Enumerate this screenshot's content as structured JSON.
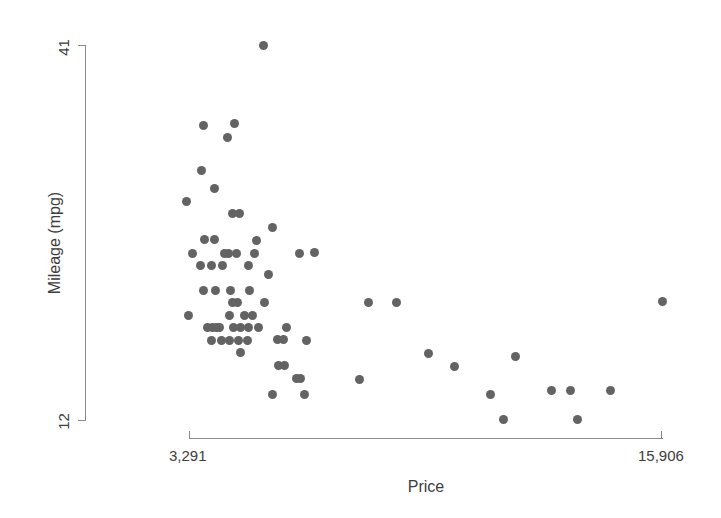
{
  "figure": {
    "width": 721,
    "height": 518,
    "background": "#ffffff",
    "marker_color": "#636363",
    "axis_color": "#8a8a8a",
    "text_color": "#3d3d3d"
  },
  "axes": {
    "y_title": "Mileage (mpg)",
    "x_title": "Price",
    "y_tick_min_label": "12",
    "y_tick_max_label": "41",
    "x_tick_min_label": "3,291",
    "x_tick_max_label": "15,906"
  },
  "chart_data": {
    "type": "scatter",
    "title": "",
    "xlabel": "Price",
    "ylabel": "Mileage (mpg)",
    "xlim": [
      3291,
      15906
    ],
    "ylim": [
      12,
      41
    ],
    "xtick_labels": [
      "3,291",
      "15,906"
    ],
    "ytick_labels": [
      "12",
      "41"
    ],
    "grid": false,
    "legend": null,
    "marker": "circle",
    "marker_color": "#636363",
    "n_points": 74,
    "points": [
      {
        "x": 5222,
        "y": 41
      },
      {
        "x": 4187,
        "y": 35
      },
      {
        "x": 4816,
        "y": 35
      },
      {
        "x": 4504,
        "y": 34
      },
      {
        "x": 4172,
        "y": 31
      },
      {
        "x": 4389,
        "y": 30
      },
      {
        "x": 3748,
        "y": 29
      },
      {
        "x": 4697,
        "y": 28
      },
      {
        "x": 4816,
        "y": 28
      },
      {
        "x": 4195,
        "y": 26
      },
      {
        "x": 4452,
        "y": 26
      },
      {
        "x": 5799,
        "y": 26
      },
      {
        "x": 6229,
        "y": 26
      },
      {
        "x": 4504,
        "y": 25
      },
      {
        "x": 4647,
        "y": 25
      },
      {
        "x": 5379,
        "y": 25
      },
      {
        "x": 8129,
        "y": 25
      },
      {
        "x": 4172,
        "y": 24
      },
      {
        "x": 4589,
        "y": 24
      },
      {
        "x": 5189,
        "y": 24
      },
      {
        "x": 5705,
        "y": 23
      },
      {
        "x": 6486,
        "y": 23
      },
      {
        "x": 4187,
        "y": 22
      },
      {
        "x": 4482,
        "y": 22
      },
      {
        "x": 4934,
        "y": 22
      },
      {
        "x": 5379,
        "y": 22
      },
      {
        "x": 4697,
        "y": 21
      },
      {
        "x": 4723,
        "y": 21
      },
      {
        "x": 6850,
        "y": 21
      },
      {
        "x": 7402,
        "y": 21
      },
      {
        "x": 15906,
        "y": 21
      },
      {
        "x": 3799,
        "y": 20
      },
      {
        "x": 4934,
        "y": 20
      },
      {
        "x": 5222,
        "y": 20
      },
      {
        "x": 4296,
        "y": 19
      },
      {
        "x": 4389,
        "y": 19
      },
      {
        "x": 4452,
        "y": 19
      },
      {
        "x": 4482,
        "y": 19
      },
      {
        "x": 4816,
        "y": 19
      },
      {
        "x": 4934,
        "y": 19
      },
      {
        "x": 5104,
        "y": 19
      },
      {
        "x": 5379,
        "y": 19
      },
      {
        "x": 4425,
        "y": 18
      },
      {
        "x": 4733,
        "y": 18
      },
      {
        "x": 4890,
        "y": 18
      },
      {
        "x": 5104,
        "y": 18
      },
      {
        "x": 5705,
        "y": 18
      },
      {
        "x": 5788,
        "y": 18
      },
      {
        "x": 4934,
        "y": 17
      },
      {
        "x": 6303,
        "y": 17
      },
      {
        "x": 8814,
        "y": 17
      },
      {
        "x": 9690,
        "y": 17
      },
      {
        "x": 5705,
        "y": 16
      },
      {
        "x": 5788,
        "y": 16
      },
      {
        "x": 9100,
        "y": 16
      },
      {
        "x": 6165,
        "y": 15
      },
      {
        "x": 7827,
        "y": 15
      },
      {
        "x": 10372,
        "y": 14
      },
      {
        "x": 11385,
        "y": 14
      },
      {
        "x": 12990,
        "y": 14
      },
      {
        "x": 13594,
        "y": 14
      },
      {
        "x": 5469,
        "y": 14
      },
      {
        "x": 6229,
        "y": 14
      },
      {
        "x": 10372,
        "y": 12
      },
      {
        "x": 13466,
        "y": 12
      }
    ]
  },
  "pixel_points": [
    [
      263,
      45
    ],
    [
      203,
      125
    ],
    [
      234,
      123
    ],
    [
      227,
      137
    ],
    [
      201,
      170
    ],
    [
      214,
      188
    ],
    [
      186,
      201
    ],
    [
      232,
      213
    ],
    [
      239,
      213
    ],
    [
      204,
      239
    ],
    [
      214,
      239
    ],
    [
      256,
      240
    ],
    [
      272,
      227
    ],
    [
      228,
      253
    ],
    [
      236,
      253
    ],
    [
      254,
      253
    ],
    [
      314,
      252
    ],
    [
      200,
      265
    ],
    [
      222,
      265
    ],
    [
      248,
      265
    ],
    [
      268,
      274
    ],
    [
      299,
      253
    ],
    [
      203,
      290
    ],
    [
      215,
      290
    ],
    [
      230,
      290
    ],
    [
      249,
      290
    ],
    [
      232,
      302
    ],
    [
      237,
      302
    ],
    [
      368,
      302
    ],
    [
      396,
      302
    ],
    [
      662,
      301
    ],
    [
      188,
      315
    ],
    [
      229,
      315
    ],
    [
      244,
      315
    ],
    [
      207,
      327
    ],
    [
      212,
      327
    ],
    [
      216,
      327
    ],
    [
      219,
      327
    ],
    [
      233,
      327
    ],
    [
      240,
      327
    ],
    [
      248,
      327
    ],
    [
      258,
      327
    ],
    [
      211,
      340
    ],
    [
      229,
      340
    ],
    [
      238,
      340
    ],
    [
      247,
      340
    ],
    [
      277,
      339
    ],
    [
      283,
      339
    ],
    [
      240,
      352
    ],
    [
      278,
      365
    ],
    [
      284,
      365
    ],
    [
      428,
      353
    ],
    [
      454,
      366
    ],
    [
      296,
      378
    ],
    [
      300,
      378
    ],
    [
      359,
      379
    ],
    [
      272,
      394
    ],
    [
      304,
      394
    ],
    [
      515,
      356
    ],
    [
      490,
      394
    ],
    [
      551,
      390
    ],
    [
      570,
      390
    ],
    [
      610,
      390
    ],
    [
      577,
      419
    ],
    [
      503,
      419
    ],
    [
      306,
      340
    ],
    [
      264,
      302
    ],
    [
      224,
      253
    ],
    [
      192,
      253
    ],
    [
      211,
      265
    ],
    [
      221,
      340
    ],
    [
      252,
      315
    ],
    [
      286,
      327
    ]
  ]
}
